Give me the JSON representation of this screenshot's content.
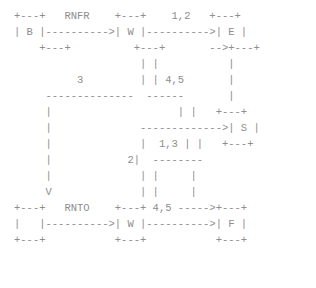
{
  "diagram": {
    "kind": "ascii-art-state-diagram",
    "title": "",
    "text_color": "#8d8d8d",
    "background_color": "#ffffff",
    "char_width_px": 5.9,
    "line_height_px": 16,
    "columns": 49,
    "rows": 17,
    "nodes": [
      {
        "id": "B",
        "label": "B",
        "row": 1,
        "col": 0
      },
      {
        "id": "W1",
        "label": "W",
        "row": 1,
        "col": 24
      },
      {
        "id": "E",
        "label": "E",
        "row": 1,
        "col": 42
      },
      {
        "id": "S",
        "label": "S",
        "row": 9,
        "col": 42
      },
      {
        "id": "W2",
        "label": "W",
        "row": 15,
        "col": 24
      },
      {
        "id": "F",
        "label": "F",
        "row": 15,
        "col": 42
      },
      {
        "id": "START",
        "label": "",
        "row": 15,
        "col": 6
      }
    ],
    "edge_labels": [
      {
        "text": "RNFR",
        "row": 0,
        "col": 9
      },
      {
        "text": "1,2",
        "row": 0,
        "col": 30
      },
      {
        "text": "3",
        "row": 5,
        "col": 17
      },
      {
        "text": "4,5",
        "row": 5,
        "col": 29
      },
      {
        "text": "1,3",
        "row": 10,
        "col": 29
      },
      {
        "text": "2",
        "row": 11,
        "col": 26
      },
      {
        "text": "RNTO",
        "row": 14,
        "col": 11
      },
      {
        "text": "4,5",
        "row": 14,
        "col": 30
      }
    ],
    "lines": [
      "+---+   RNFR    +---+    1,2   +---+",
      "| B |---------->| W |---------->| E |",
      "    +---+           +---+        -->+---+",
      "                     | |           |",
      "          3          | | 4,5       |",
      "     ---------------  ------       |",
      "     |                      | |    +---+",
      "     |               ------------->| S |",
      "     |               |  1,3 | |    +---+",
      "     |             2|  --------",
      "     |               | |     |",
      "     V               | |     |",
      "+---+   RNTO    +---+ 4,5 ----->+---+",
      "|   |---------->| W |---------->| F |",
      "+---+           +---+           +---+"
    ],
    "raw_rows": [
      "+---+   RNFR     +---+     1,2    +---+",
      "| B |----------->| W |----------->| E |",
      "    +---+            +---+         -->+---+",
      "                      | |             |",
      "           3          | | 4,5         |",
      "      --------------   ------         |",
      "      |                        | |    +---+",
      "      |                -------------->| S |",
      "      |                |  1,3 | |     +---+",
      "      |              2|  --------",
      "      |                | |      |",
      "      |                | |      |",
      "      V                | |      |",
      "+---+    RNTO     +---+ 4,5 ----->+---+",
      "|   |------------>| W |----------->| F |",
      "+---+             +---+            +---+"
    ]
  },
  "art": "+---+   RNFR    +---+    1,2   +---+\n| B |---------->| W |---------->| E |\n    +---+          +---+       -->+---+\n                    | |           |\n          3         | | 4,5       |\n     --------------  ------       |\n     |                    | |   +---+\n     |              ------------->| S |\n     |              |  1,3 | |   +---+\n     |            2|  --------\n     |              | |     |\n     V              | |     |\n+---+   RNTO    +---+ 4,5 ----->+---+\n|   |---------->| W |---------->| F |\n+---+           +---+           +---+"
}
